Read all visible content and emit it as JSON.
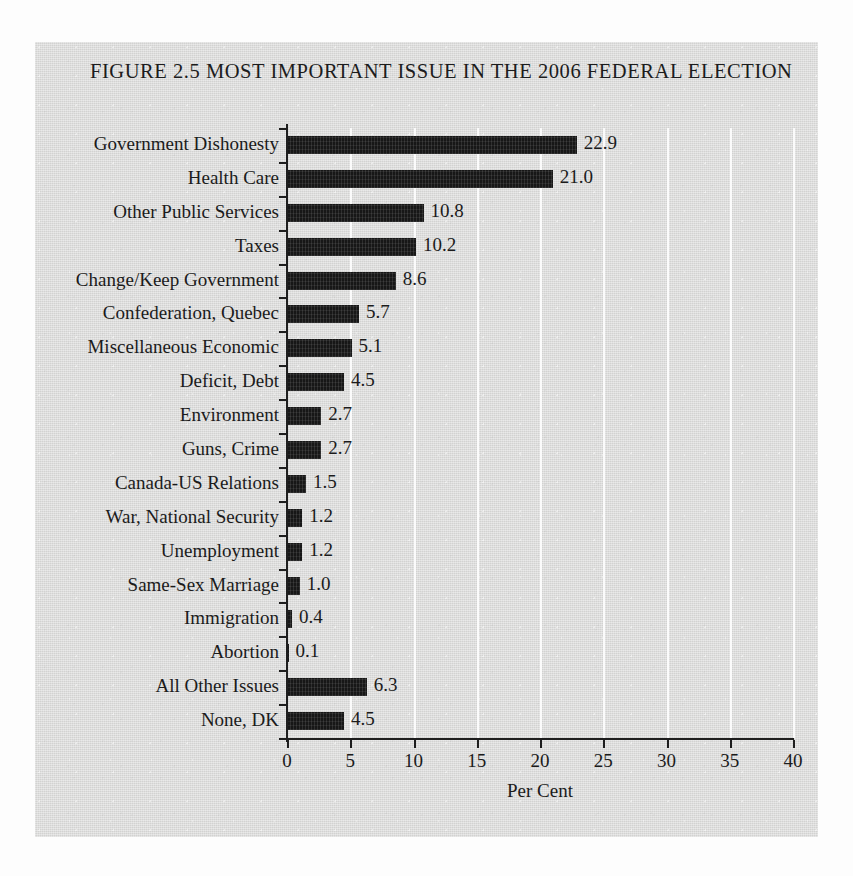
{
  "figure": {
    "title": "FIGURE 2.5 MOST IMPORTANT ISSUE IN THE 2006 FEDERAL ELECTION",
    "background_color": "#d7d7d6",
    "bar_color": "#171717",
    "gridline_color": "#fbfbfb",
    "axis_color": "#1e1e1e",
    "text_color": "#1b1b1b"
  },
  "chart_data": {
    "type": "bar",
    "orientation": "horizontal",
    "title": "FIGURE 2.5 MOST IMPORTANT ISSUE IN THE 2006 FEDERAL ELECTION",
    "xlabel": "Per Cent",
    "ylabel": "",
    "xlim": [
      0,
      40
    ],
    "xticks": [
      0,
      5,
      10,
      15,
      20,
      25,
      30,
      35,
      40
    ],
    "xtick_labels": [
      "0",
      "5",
      "10",
      "15",
      "20",
      "25",
      "30",
      "35",
      "40"
    ],
    "grid": "vertical",
    "legend": "none",
    "categories": [
      "Government Dishonesty",
      "Health Care",
      "Other Public Services",
      "Taxes",
      "Change/Keep Government",
      "Confederation, Quebec",
      "Miscellaneous Economic",
      "Deficit, Debt",
      "Environment",
      "Guns, Crime",
      "Canada-US Relations",
      "War, National Security",
      "Unemployment",
      "Same-Sex Marriage",
      "Immigration",
      "Abortion",
      "All Other Issues",
      "None, DK"
    ],
    "values": [
      22.9,
      21.0,
      10.8,
      10.2,
      8.6,
      5.7,
      5.1,
      4.5,
      2.7,
      2.7,
      1.5,
      1.2,
      1.2,
      1.0,
      0.4,
      0.1,
      6.3,
      4.5
    ],
    "value_labels": [
      "22.9",
      "21.0",
      "10.8",
      "10.2",
      "8.6",
      "5.7",
      "5.1",
      "4.5",
      "2.7",
      "2.7",
      "1.5",
      "1.2",
      "1.2",
      "1.0",
      "0.4",
      "0.1",
      "6.3",
      "4.5"
    ]
  }
}
